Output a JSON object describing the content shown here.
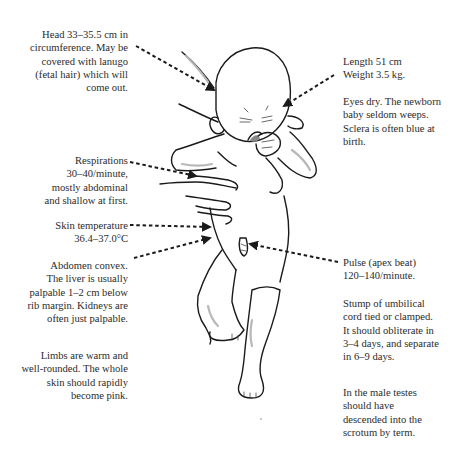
{
  "diagram": {
    "annotations": {
      "head": {
        "text": "Head 33–35.5 cm in\ncircumference. May be\ncovered with lanugo\n(fetal hair) which will\ncome out."
      },
      "length_weight": {
        "text": "Length 51 cm\nWeight 3.5 kg."
      },
      "eyes": {
        "text": "Eyes dry. The newborn\nbaby seldom weeps.\nSclera is often blue at\nbirth."
      },
      "respirations": {
        "text": "Respirations\n30–40/minute,\nmostly abdominal\nand shallow at first."
      },
      "skin_temperature": {
        "text": "Skin temperature\n36.4–37.0°C"
      },
      "abdomen": {
        "text": "Abdomen convex.\nThe liver is usually\npalpable 1–2 cm below\nrib margin. Kidneys are\noften just palpable."
      },
      "limbs": {
        "text": "Limbs are warm and\nwell-rounded. The whole\nskin should rapidly\nbecome pink."
      },
      "pulse": {
        "text": "Pulse (apex beat)\n120–140/minute."
      },
      "umbilical": {
        "text": "Stump of umbilical\ncord tied or clamped.\nIt should obliterate in\n3–4 days, and separate\nin 6–9 days."
      },
      "testes": {
        "text": "In the male testes\nshould have\ndescended into the\nscrotum by term."
      }
    },
    "colors": {
      "ink": "#1a1a1a",
      "text": "#2b2b2b",
      "shading": "#b8b8b8",
      "background": "#ffffff"
    }
  }
}
